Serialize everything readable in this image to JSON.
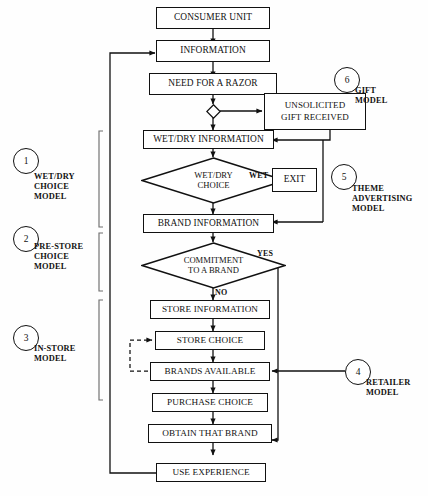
{
  "diagram": {
    "nodes": [
      {
        "id": "consumer_unit",
        "label": "CONSUMER UNIT",
        "shape": "box"
      },
      {
        "id": "information",
        "label": "INFORMATION",
        "shape": "box"
      },
      {
        "id": "need_razor",
        "label": "NEED FOR A RAZOR",
        "shape": "box"
      },
      {
        "id": "gift_junction",
        "label": "",
        "shape": "small-diamond"
      },
      {
        "id": "unsolicited_gift",
        "label": "UNSOLICITED GIFT RECEIVED",
        "shape": "box"
      },
      {
        "id": "wetdry_information",
        "label": "WET/DRY INFORMATION",
        "shape": "box"
      },
      {
        "id": "wetdry_choice",
        "label": "WET/DRY CHOICE",
        "shape": "diamond"
      },
      {
        "id": "exit",
        "label": "EXIT",
        "shape": "box"
      },
      {
        "id": "brand_information",
        "label": "BRAND INFORMATION",
        "shape": "box"
      },
      {
        "id": "commitment_brand",
        "label": "COMMITMENT TO A BRAND",
        "shape": "diamond"
      },
      {
        "id": "store_information",
        "label": "STORE INFORMATION",
        "shape": "box"
      },
      {
        "id": "store_choice",
        "label": "STORE CHOICE",
        "shape": "box"
      },
      {
        "id": "brands_available",
        "label": "BRANDS AVAILABLE",
        "shape": "box"
      },
      {
        "id": "purchase_choice",
        "label": "PURCHASE CHOICE",
        "shape": "box"
      },
      {
        "id": "obtain_brand",
        "label": "OBTAIN THAT BRAND",
        "shape": "box"
      },
      {
        "id": "use_experience",
        "label": "USE EXPERIENCE",
        "shape": "box"
      }
    ],
    "branch_labels": [
      {
        "id": "wet",
        "text": "WET",
        "from": "wetdry_choice",
        "to": "exit"
      },
      {
        "id": "yes",
        "text": "YES",
        "from": "commitment_brand",
        "to": "obtain_brand"
      },
      {
        "id": "no",
        "text": "NO",
        "from": "commitment_brand",
        "to": "store_information"
      }
    ],
    "sub_models": [
      {
        "number": "1",
        "name": "WET/DRY CHOICE MODEL",
        "side": "left",
        "lines": [
          "WET/DRY",
          "CHOICE",
          "MODEL"
        ]
      },
      {
        "number": "2",
        "name": "PRE-STORE CHOICE MODEL",
        "side": "left",
        "lines": [
          "PRE-STORE",
          "CHOICE",
          "MODEL"
        ]
      },
      {
        "number": "3",
        "name": "IN-STORE MODEL",
        "side": "left",
        "lines": [
          "IN-STORE",
          "MODEL"
        ]
      },
      {
        "number": "4",
        "name": "RETAILER MODEL",
        "side": "right",
        "lines": [
          "RETAILER",
          "MODEL"
        ]
      },
      {
        "number": "5",
        "name": "THEME ADVERTISING MODEL",
        "side": "right",
        "lines": [
          "THEME",
          "ADVERTISING",
          "MODEL"
        ]
      },
      {
        "number": "6",
        "name": "GIFT MODEL",
        "side": "right",
        "lines": [
          "GIFT",
          "MODEL"
        ]
      }
    ],
    "colors": {
      "line": "#111111",
      "box_fill": "#ffffff",
      "background": "#fefefe",
      "text": "#121212"
    }
  }
}
